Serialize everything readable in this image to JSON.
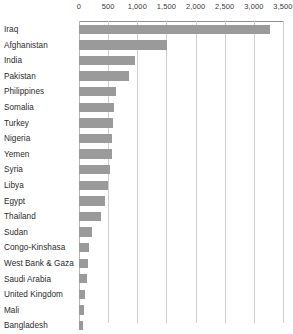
{
  "chart_data": {
    "type": "bar",
    "orientation": "horizontal",
    "title": "",
    "subtitle": "",
    "xlabel": "",
    "ylabel": "",
    "xlim": [
      0,
      3500
    ],
    "xticks": [
      0,
      500,
      1000,
      1500,
      2000,
      2500,
      3000,
      3500
    ],
    "xtick_labels": [
      "0",
      "500",
      "1,000",
      "1,500",
      "2,000",
      "2,500",
      "3,000",
      "3,500"
    ],
    "grid": true,
    "grid_axis": "x",
    "legend": false,
    "legend_position": "none",
    "bar_color": "#9a9a9a",
    "gridline_color": "#cfcfcf",
    "axis_color": "#8e8e8e",
    "text_color": "#2b2b2b",
    "categories": [
      "Iraq",
      "Afghanistan",
      "India",
      "Pakistan",
      "Philippines",
      "Somalia",
      "Turkey",
      "Nigeria",
      "Yemen",
      "Syria",
      "Libya",
      "Egypt",
      "Thailand",
      "Sudan",
      "Congo-Kinshasa",
      "West Bank & Gaza",
      "Saudi Arabia",
      "United Kingdom",
      "Mali",
      "Bangladesh"
    ],
    "values": [
      3270,
      1510,
      965,
      850,
      630,
      600,
      580,
      570,
      560,
      530,
      490,
      450,
      370,
      220,
      180,
      160,
      130,
      105,
      90,
      70
    ]
  }
}
